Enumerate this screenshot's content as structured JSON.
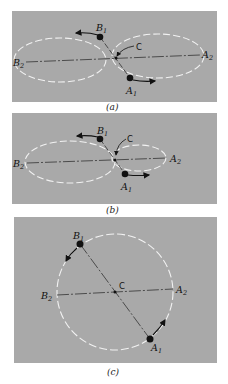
{
  "figure": {
    "background": "#ffffff",
    "panel_color": "#a9a9a9",
    "orbit_color": "#f2f2f2",
    "panels": [
      {
        "id": "a",
        "caption": "(a)",
        "labels": {
          "B1": "B",
          "B1_sub": "1",
          "B2": "B",
          "B2_sub": "2",
          "A1": "A",
          "A1_sub": "1",
          "A2": "A",
          "A2_sub": "2",
          "C": "C"
        },
        "description": "Two unequal-mass... equal ellipses overlapping around center of mass C"
      },
      {
        "id": "b",
        "caption": "(b)",
        "labels": {
          "B1": "B",
          "B1_sub": "1",
          "B2": "B",
          "B2_sub": "2",
          "A1": "A",
          "A1_sub": "1",
          "A2": "A",
          "A2_sub": "2",
          "C": "C"
        },
        "description": "Larger ellipse for B, smaller ellipse for A around center of mass C"
      },
      {
        "id": "c",
        "caption": "(c)",
        "labels": {
          "B1": "B",
          "B1_sub": "1",
          "B2": "B",
          "B2_sub": "2",
          "A1": "A",
          "A1_sub": "1",
          "A2": "A",
          "A2_sub": "2",
          "C": "C"
        },
        "description": "Single shared circular orbit around center C"
      }
    ]
  }
}
